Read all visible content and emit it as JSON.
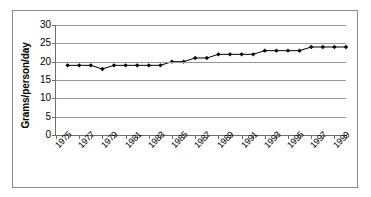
{
  "chart_data": {
    "type": "line",
    "title": "",
    "xlabel": "",
    "ylabel": "Grams/person/day",
    "ylim": [
      0,
      30
    ],
    "yticks": [
      0,
      5,
      10,
      15,
      20,
      25,
      30
    ],
    "ytick_labels": [
      "0",
      "5",
      "10",
      "15",
      "20",
      "25",
      "30"
    ],
    "grid": true,
    "legend": "none",
    "marker": "diamond",
    "line_color": "#000000",
    "marker_color": "#000000",
    "grid_color": "#9a9a9a",
    "axis_color": "#6e6e6e",
    "border_color": "#8a8a8a",
    "x_axis_start": 1975,
    "x_axis_end": 2000,
    "xtick_labels": [
      "1975",
      "1977",
      "1979",
      "1981",
      "1983",
      "1985",
      "1987",
      "1989",
      "1991",
      "1993",
      "1995",
      "1997",
      "1999"
    ],
    "x": [
      1976,
      1977,
      1978,
      1979,
      1980,
      1981,
      1982,
      1983,
      1984,
      1985,
      1986,
      1987,
      1988,
      1989,
      1990,
      1991,
      1992,
      1993,
      1994,
      1995,
      1996,
      1997,
      1998,
      1999,
      2000
    ],
    "values": [
      19,
      19,
      19,
      18,
      19,
      19,
      19,
      19,
      19,
      20,
      20,
      21,
      21,
      22,
      22,
      22,
      22,
      23,
      23,
      23,
      23,
      24,
      24,
      24,
      24
    ]
  }
}
